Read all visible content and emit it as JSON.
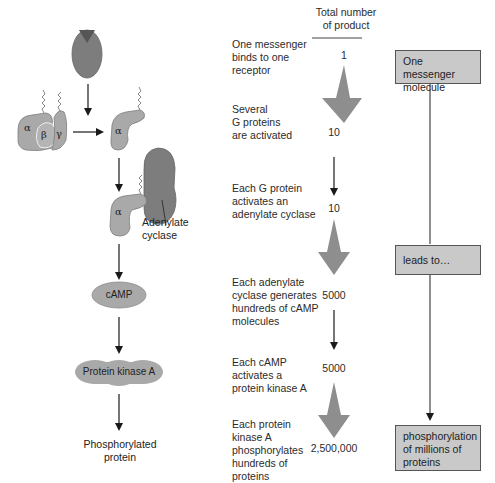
{
  "header": {
    "line1": "Total number",
    "line2": "of product"
  },
  "pathway": {
    "alpha": "α",
    "beta": "β",
    "gamma": "γ",
    "adenylate_label_1": "Adenylate",
    "adenylate_label_2": "cyclase",
    "camp_label": "cAMP",
    "pka_label": "Protein kinase A",
    "phospho_1": "Phosphorylated",
    "phospho_2": "protein"
  },
  "steps": [
    {
      "lines": [
        "One messenger",
        "binds to one",
        "receptor"
      ],
      "count": "1"
    },
    {
      "lines": [
        "Several",
        "G proteins",
        "are activated"
      ],
      "count": "10"
    },
    {
      "lines": [
        "Each G protein",
        "activates an",
        "adenylate cyclase"
      ],
      "count": "10"
    },
    {
      "lines": [
        "Each adenylate",
        "cyclase generates",
        "hundreds of cAMP",
        "molecules"
      ],
      "count": "5000"
    },
    {
      "lines": [
        "Each cAMP",
        "activates a",
        "protein kinase A"
      ],
      "count": "5000"
    },
    {
      "lines": [
        "Each protein",
        "kinase A",
        "phosphorylates",
        "hundreds of",
        "proteins"
      ],
      "count": "2,500,000"
    }
  ],
  "summary_boxes": [
    {
      "lines": [
        "One messenger",
        "molecule"
      ]
    },
    {
      "lines": [
        "leads to…"
      ]
    },
    {
      "lines": [
        "phosphorylation",
        "of millions of",
        "proteins"
      ]
    }
  ],
  "colors": {
    "protein_fill": "#a9a9a9",
    "receptor_fill": "#7a7a7a",
    "box_fill": "#c9c9c9",
    "big_arrow": "#8e8e8e"
  }
}
